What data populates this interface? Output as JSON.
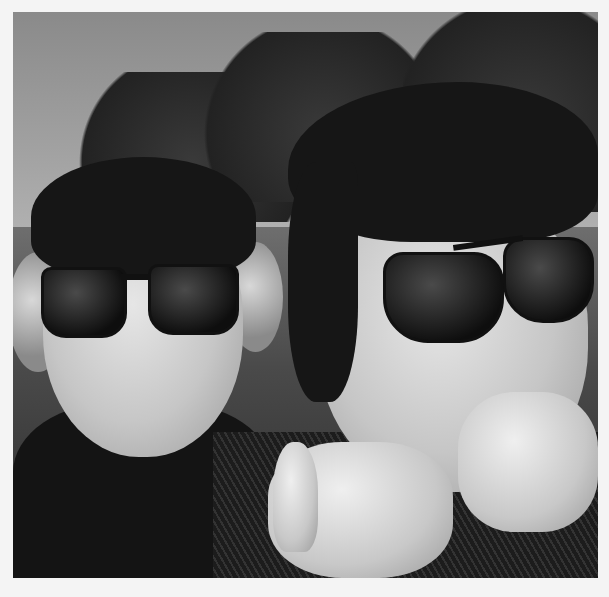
{
  "image": {
    "description": "Black-and-white selfie of two young men wearing sunglasses and ear protection headphones outdoors, trees and sky in background, one pointing at the camera",
    "style": "grayscale photograph with white border",
    "colors": {
      "border": "#f4f4f4",
      "sky": "#a0a0a0",
      "foliage": "#222222",
      "shadow": "#111111"
    },
    "subjects": [
      {
        "name": "left-person",
        "features": [
          "dark fringe hair",
          "rectangular sunglasses",
          "over-ear headphones",
          "pursed smile",
          "dark t-shirt"
        ]
      },
      {
        "name": "right-person",
        "features": [
          "dark swept hair",
          "round-top sunglasses",
          "pointing hand gesture",
          "dark patterned top"
        ]
      }
    ]
  }
}
